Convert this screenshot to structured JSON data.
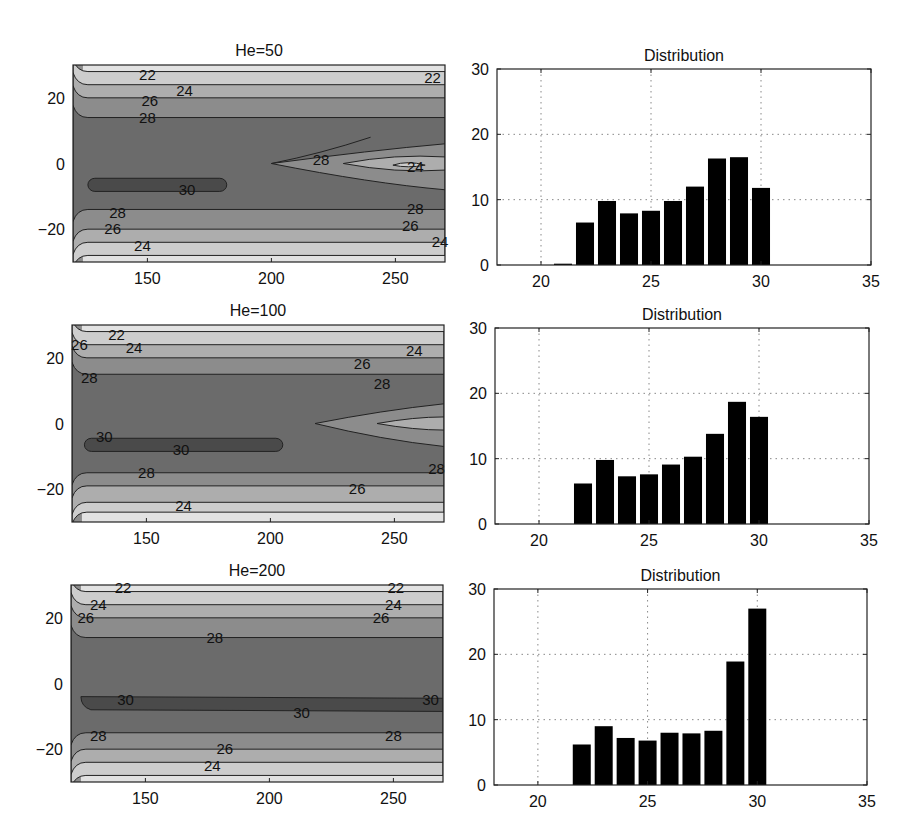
{
  "figure": {
    "rows": [
      {
        "contour_title": "He=50",
        "hist_title": "Distribution"
      },
      {
        "contour_title": "He=100",
        "hist_title": "Distribution"
      },
      {
        "contour_title": "He=200",
        "hist_title": "Distribution"
      }
    ]
  },
  "colors": {
    "level_30": "#4a4a4a",
    "level_28": "#6b6b6b",
    "level_26": "#8c8c8c",
    "level_24": "#adadad",
    "level_22": "#cdcdcd",
    "level_low": "#e2e2e2",
    "bar": "#000000",
    "grid": "#888888"
  },
  "chart_data": [
    {
      "type": "contour",
      "title": "He=50",
      "xlabel": "",
      "ylabel": "",
      "xlim": [
        120,
        270
      ],
      "ylim": [
        -30,
        30
      ],
      "xticks": [
        150,
        200,
        250
      ],
      "yticks": [
        -20,
        0,
        20
      ],
      "levels": [
        22,
        24,
        26,
        28,
        30
      ],
      "contour_labels": [
        {
          "text": "22",
          "x": 150,
          "y": 27
        },
        {
          "text": "24",
          "x": 165,
          "y": 22
        },
        {
          "text": "26",
          "x": 151,
          "y": 19
        },
        {
          "text": "28",
          "x": 150,
          "y": 14
        },
        {
          "text": "28",
          "x": 220,
          "y": 1
        },
        {
          "text": "30",
          "x": 166,
          "y": -8
        },
        {
          "text": "24",
          "x": 258,
          "y": -1
        },
        {
          "text": "22",
          "x": 265,
          "y": 26
        },
        {
          "text": "28",
          "x": 258,
          "y": -14
        },
        {
          "text": "26",
          "x": 256,
          "y": -19
        },
        {
          "text": "24",
          "x": 268,
          "y": -24
        },
        {
          "text": "28",
          "x": 138,
          "y": -15
        },
        {
          "text": "26",
          "x": 136,
          "y": -20
        },
        {
          "text": "24",
          "x": 148,
          "y": -25
        }
      ]
    },
    {
      "type": "bar",
      "title": "Distribution",
      "xlabel": "",
      "ylabel": "",
      "xlim": [
        18,
        35
      ],
      "ylim": [
        0,
        30
      ],
      "xticks": [
        20,
        25,
        30,
        35
      ],
      "yticks": [
        0,
        10,
        20,
        30
      ],
      "grid": true,
      "categories": [
        21,
        22,
        23,
        24,
        25,
        26,
        27,
        28,
        29,
        30
      ],
      "values": [
        0.2,
        6.5,
        9.8,
        7.9,
        8.3,
        9.8,
        12.0,
        16.3,
        16.5,
        11.8
      ]
    },
    {
      "type": "contour",
      "title": "He=100",
      "xlabel": "",
      "ylabel": "",
      "xlim": [
        120,
        270
      ],
      "ylim": [
        -30,
        30
      ],
      "xticks": [
        150,
        200,
        250
      ],
      "yticks": [
        -20,
        0,
        20
      ],
      "levels": [
        22,
        24,
        26,
        28,
        30
      ],
      "contour_labels": [
        {
          "text": "22",
          "x": 138,
          "y": 27
        },
        {
          "text": "24",
          "x": 145,
          "y": 23
        },
        {
          "text": "26",
          "x": 123,
          "y": 24
        },
        {
          "text": "28",
          "x": 127,
          "y": 14
        },
        {
          "text": "30",
          "x": 133,
          "y": -4
        },
        {
          "text": "30",
          "x": 164,
          "y": -8
        },
        {
          "text": "28",
          "x": 150,
          "y": -15
        },
        {
          "text": "24",
          "x": 165,
          "y": -25
        },
        {
          "text": "26",
          "x": 237,
          "y": 18
        },
        {
          "text": "28",
          "x": 245,
          "y": 12
        },
        {
          "text": "24",
          "x": 258,
          "y": 22
        },
        {
          "text": "28",
          "x": 267,
          "y": -14
        },
        {
          "text": "26",
          "x": 235,
          "y": -20
        }
      ]
    },
    {
      "type": "bar",
      "title": "Distribution",
      "xlabel": "",
      "ylabel": "",
      "xlim": [
        18,
        35
      ],
      "ylim": [
        0,
        30
      ],
      "xticks": [
        20,
        25,
        30,
        35
      ],
      "yticks": [
        0,
        10,
        20,
        30
      ],
      "grid": true,
      "categories": [
        22,
        23,
        24,
        25,
        26,
        27,
        28,
        29,
        30
      ],
      "values": [
        6.2,
        9.8,
        7.3,
        7.6,
        9.1,
        10.3,
        13.8,
        18.7,
        16.4
      ]
    },
    {
      "type": "contour",
      "title": "He=200",
      "xlabel": "",
      "ylabel": "",
      "xlim": [
        120,
        270
      ],
      "ylim": [
        -30,
        30
      ],
      "xticks": [
        150,
        200,
        250
      ],
      "yticks": [
        -20,
        0,
        20
      ],
      "levels": [
        22,
        24,
        26,
        28,
        30
      ],
      "contour_labels": [
        {
          "text": "22",
          "x": 141,
          "y": 29
        },
        {
          "text": "24",
          "x": 131,
          "y": 24
        },
        {
          "text": "26",
          "x": 126,
          "y": 20
        },
        {
          "text": "28",
          "x": 178,
          "y": 14
        },
        {
          "text": "30",
          "x": 142,
          "y": -5
        },
        {
          "text": "30",
          "x": 213,
          "y": -9
        },
        {
          "text": "30",
          "x": 265,
          "y": -5
        },
        {
          "text": "28",
          "x": 131,
          "y": -16
        },
        {
          "text": "28",
          "x": 250,
          "y": -16
        },
        {
          "text": "26",
          "x": 182,
          "y": -20
        },
        {
          "text": "24",
          "x": 177,
          "y": -25
        },
        {
          "text": "26",
          "x": 245,
          "y": 20
        },
        {
          "text": "24",
          "x": 250,
          "y": 24
        },
        {
          "text": "22",
          "x": 251,
          "y": 29
        }
      ]
    },
    {
      "type": "bar",
      "title": "Distribution",
      "xlabel": "",
      "ylabel": "",
      "xlim": [
        18,
        35
      ],
      "ylim": [
        0,
        30
      ],
      "xticks": [
        20,
        25,
        30,
        35
      ],
      "yticks": [
        0,
        10,
        20,
        30
      ],
      "grid": true,
      "categories": [
        22,
        23,
        24,
        25,
        26,
        27,
        28,
        29,
        30
      ],
      "values": [
        6.2,
        9.0,
        7.2,
        6.8,
        8.0,
        7.9,
        8.3,
        18.9,
        27.0
      ]
    }
  ]
}
